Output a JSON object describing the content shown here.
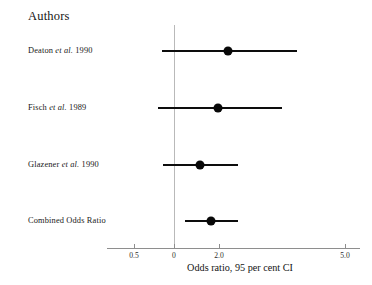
{
  "figure": {
    "heading": "Authors",
    "axis_title": "Odds ratio, 95 per cent CI",
    "reference_value_label": "0",
    "line_color": "#0d0d0d",
    "reference_line_color": "#b9b9b9",
    "axis_color": "#8e8e8e",
    "background": "#ffffff"
  },
  "chart_data": {
    "type": "forest",
    "title": "",
    "xlabel": "Odds ratio, 95 per cent CI",
    "ylabel": "Authors",
    "grid": false,
    "legend": "none",
    "xticks": [
      {
        "label": "0.5",
        "px": 134
      },
      {
        "label": "0",
        "px": 174
      },
      {
        "label": "2.0",
        "px": 219
      },
      {
        "label": "5.0",
        "px": 345
      }
    ],
    "reference_line": {
      "label": "0",
      "px": 174
    },
    "axis_px_range": [
      107,
      360
    ],
    "categories": [
      "Deaton et al. 1990",
      "Fisch et al. 1989",
      "Glazener et al. 1990",
      "Combined Odds Ratio"
    ],
    "rows": [
      {
        "label_prefix": "Deaton",
        "label_italic": "et al.",
        "label_suffix": "1990",
        "label_full": "Deaton et al. 1990",
        "label_y": 52,
        "marker_y": 50,
        "ci_low_px": 162,
        "ci_high_px": 297,
        "point_px": 228,
        "odds_ratio": 2.3,
        "ci_low": 0.7,
        "ci_high": 3.9
      },
      {
        "label_prefix": "Fisch",
        "label_italic": "et al.",
        "label_suffix": "1989",
        "label_full": "Fisch et al. 1989",
        "label_y": 109,
        "marker_y": 107,
        "ci_low_px": 158,
        "ci_high_px": 282,
        "point_px": 218,
        "odds_ratio": 2.0,
        "ci_low": 0.6,
        "ci_high": 3.5
      },
      {
        "label_prefix": "Glazener",
        "label_italic": "et al.",
        "label_suffix": "1990",
        "label_full": "Glazener et al. 1990",
        "label_y": 166,
        "marker_y": 164,
        "ci_low_px": 163,
        "ci_high_px": 238,
        "point_px": 200,
        "odds_ratio": 1.6,
        "ci_low": 0.7,
        "ci_high": 2.5
      },
      {
        "label_prefix": "Combined Odds Ratio",
        "label_italic": "",
        "label_suffix": "",
        "label_full": "Combined Odds Ratio",
        "label_y": 222,
        "marker_y": 220,
        "ci_low_px": 185,
        "ci_high_px": 238,
        "point_px": 211,
        "odds_ratio": 1.85,
        "ci_low": 1.25,
        "ci_high": 2.5
      }
    ]
  }
}
